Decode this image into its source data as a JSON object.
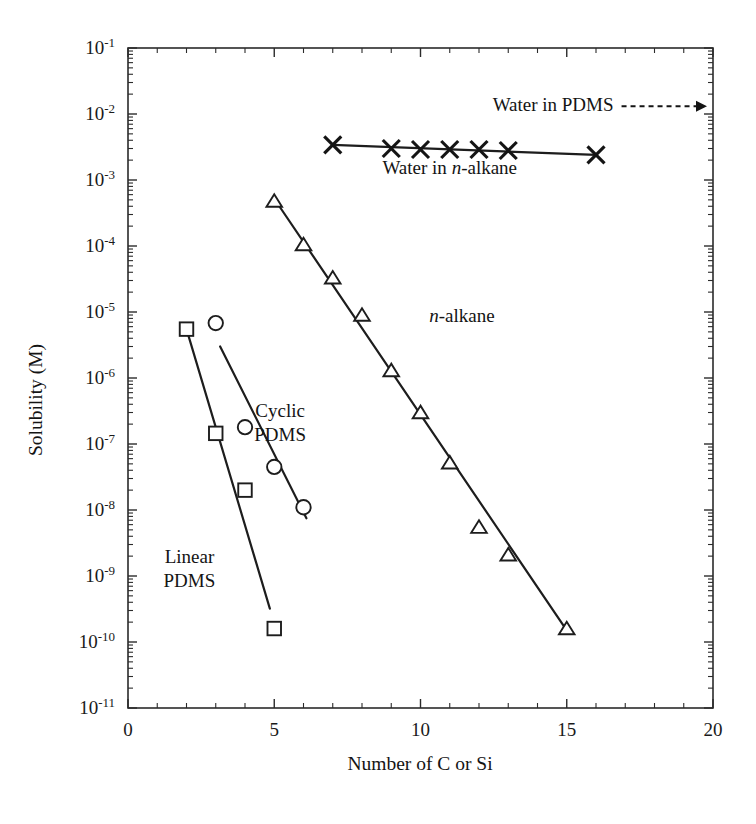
{
  "chart_data": {
    "type": "scatter",
    "title": "",
    "xlabel": "Number of C or Si",
    "ylabel": "Solubility (M)",
    "xlim": [
      0,
      20
    ],
    "ylim_log10": [
      -11,
      -1
    ],
    "xticks": [
      0,
      5,
      10,
      15,
      20
    ],
    "xtick_labels": [
      "0",
      "5",
      "10",
      "15",
      "20"
    ],
    "yticks_log10": [
      -1,
      -2,
      -3,
      -4,
      -5,
      -6,
      -7,
      -8,
      -9,
      -10,
      -11
    ],
    "ytick_labels": [
      "10-1",
      "10-2",
      "10-3",
      "10-4",
      "10-5",
      "10-6",
      "10-7",
      "10-8",
      "10-9",
      "10-10",
      "10-11"
    ],
    "ytick_mantissa": "10",
    "ytick_exponents": [
      "-1",
      "-2",
      "-3",
      "-4",
      "-5",
      "-6",
      "-7",
      "-8",
      "-9",
      "-10",
      "-11"
    ],
    "xscale": "linear",
    "yscale": "log",
    "grid": false,
    "legend": "inline-annotations",
    "minor_ticks": true,
    "frame": "full-box",
    "series": [
      {
        "name": "Water in n-alkane",
        "label_html": "Water in <i>n</i>-alkane",
        "marker": "cross",
        "x": [
          7,
          9,
          10,
          11,
          12,
          13,
          16
        ],
        "y": [
          0.0034,
          0.003,
          0.0029,
          0.0029,
          0.0029,
          0.0028,
          0.0024
        ],
        "fit_line": {
          "x": [
            7,
            16
          ],
          "y": [
            0.0034,
            0.0024
          ]
        }
      },
      {
        "name": "n-alkane",
        "label_html": "<i>n</i>-alkane",
        "marker": "triangle-open",
        "x": [
          5,
          6,
          7,
          8,
          9,
          10,
          11,
          12,
          13,
          15
        ],
        "y": [
          0.00048,
          0.000105,
          3.3e-05,
          9e-06,
          1.3e-06,
          3e-07,
          5.2e-08,
          5.5e-09,
          2.1e-09,
          1.6e-10
        ],
        "fit_line": {
          "x": [
            5,
            15
          ],
          "y": [
            0.00052,
            1.5e-10
          ]
        }
      },
      {
        "name": "Cyclic PDMS",
        "label_html": "Cyclic<br>PDMS",
        "marker": "circle-open",
        "x": [
          3,
          4,
          5,
          6
        ],
        "y": [
          6.8e-06,
          1.8e-07,
          4.5e-08,
          1.1e-08
        ],
        "fit_line": {
          "x": [
            3.15,
            6.1
          ],
          "y": [
            3e-06,
            7.5e-09
          ]
        }
      },
      {
        "name": "Linear PDMS",
        "label_html": "Linear<br>PDMS",
        "marker": "square-open",
        "x": [
          2,
          3,
          4,
          5
        ],
        "y": [
          5.5e-06,
          1.45e-07,
          2e-08,
          1.6e-10
        ],
        "fit_line": {
          "x": [
            2,
            4.85
          ],
          "y": [
            5.5e-06,
            3.2e-10
          ]
        }
      }
    ],
    "annotations": [
      {
        "name": "water-in-pdms-annotation",
        "text": "Water in PDMS",
        "arrow": "dashed-right",
        "x_text": 16.6,
        "y_text": 0.011,
        "arrow_to_x": 20
      },
      {
        "name": "water-in-n-alkane-label",
        "text_plain": "Water in n-alkane",
        "x": 11.0,
        "y": 0.00125
      },
      {
        "name": "n-alkane-label",
        "text_plain": "n-alkane",
        "x": 10.3,
        "y": 7e-06
      },
      {
        "name": "cyclic-pdms-label",
        "line1": "Cyclic",
        "line2": "PDMS",
        "x": 5.2,
        "y": 2.6e-07
      },
      {
        "name": "linear-pdms-label",
        "line1": "Linear",
        "line2": "PDMS",
        "x": 2.1,
        "y": 1.6e-09
      }
    ]
  },
  "labels": {
    "ylabel": "Solubility (M)",
    "xlabel": "Number of C or Si",
    "water_pdms": "Water in PDMS",
    "water_alkane_prefix": "Water in ",
    "water_alkane_ital": "n",
    "water_alkane_suffix": "-alkane",
    "alkane_ital": "n",
    "alkane_suffix": "-alkane",
    "cyclic_line1": "Cyclic",
    "cyclic_line2": "PDMS",
    "linear_line1": "Linear",
    "linear_line2": "PDMS"
  },
  "colors": {
    "ink": "#1a1a1a",
    "line": "#1d1d1d",
    "background": "#ffffff"
  }
}
